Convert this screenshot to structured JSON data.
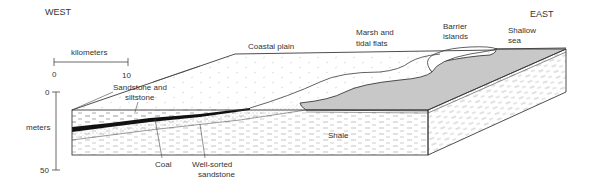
{
  "diagram": {
    "directions": {
      "west": "WEST",
      "east": "EAST"
    },
    "scale_bar": {
      "unit_label": "kilometers",
      "start": "0",
      "end": "10"
    },
    "depth_axis": {
      "unit_label": "meters",
      "top": "0",
      "bottom": "50"
    },
    "labels": {
      "coastal_plain": "Coastal plain",
      "marsh_line1": "Marsh and",
      "marsh_line2": "tidal flats",
      "barrier_line1": "Barrier",
      "barrier_line2": "islands",
      "sea_line1": "Shallow",
      "sea_line2": "sea",
      "sandstone_line1": "Sandstone and",
      "sandstone_line2": "siltstone",
      "shale": "Shale",
      "coal": "Coal",
      "wellsorted_line1": "Well-sorted",
      "wellsorted_line2": "sandstone"
    },
    "colors": {
      "line": "#3a3a3a",
      "sea_fill": "#c8c8c8",
      "coal_fill": "#111111",
      "text": "#333333"
    }
  }
}
